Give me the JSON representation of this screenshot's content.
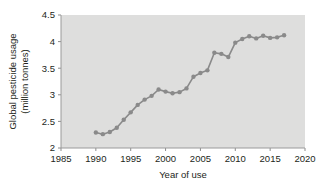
{
  "chart_data": {
    "type": "line",
    "title": "",
    "xlabel": "Year of use",
    "ylabel": "Global pesticide usage (million tonnes)",
    "ylabel_line1": "Global pesticide usage",
    "ylabel_line2": "(million tonnes)",
    "xlim": [
      1985,
      2020
    ],
    "ylim": [
      2,
      4.5
    ],
    "xticks": [
      1985,
      1990,
      1995,
      2000,
      2005,
      2010,
      2015,
      2020
    ],
    "yticks": [
      2,
      2.5,
      3,
      3.5,
      4,
      4.5
    ],
    "xtick_labels": [
      "1985",
      "1990",
      "1995",
      "2000",
      "2005",
      "2010",
      "2015",
      "2020"
    ],
    "ytick_labels": [
      "2",
      "2.5",
      "3",
      "3.5",
      "4",
      "4.5"
    ],
    "grid": false,
    "legend": false,
    "marker": "circle",
    "series_color": "#8a8a8a",
    "plot_background": "#dededd",
    "x": [
      1990,
      1991,
      1992,
      1993,
      1994,
      1995,
      1996,
      1997,
      1998,
      1999,
      2000,
      2001,
      2002,
      2003,
      2004,
      2005,
      2006,
      2007,
      2008,
      2009,
      2010,
      2011,
      2012,
      2013,
      2014,
      2015,
      2016,
      2017
    ],
    "values": [
      2.29,
      2.26,
      2.3,
      2.38,
      2.53,
      2.67,
      2.81,
      2.91,
      2.98,
      3.1,
      3.06,
      3.03,
      3.05,
      3.12,
      3.34,
      3.41,
      3.46,
      3.79,
      3.77,
      3.71,
      3.98,
      4.05,
      4.1,
      4.06,
      4.11,
      4.07,
      4.08,
      4.12
    ],
    "series": [
      {
        "name": "Global pesticide usage",
        "values": [
          2.29,
          2.26,
          2.3,
          2.38,
          2.53,
          2.67,
          2.81,
          2.91,
          2.98,
          3.1,
          3.06,
          3.03,
          3.05,
          3.12,
          3.34,
          3.41,
          3.46,
          3.79,
          3.77,
          3.71,
          3.98,
          4.05,
          4.1,
          4.06,
          4.11,
          4.07,
          4.08,
          4.12
        ]
      }
    ]
  }
}
